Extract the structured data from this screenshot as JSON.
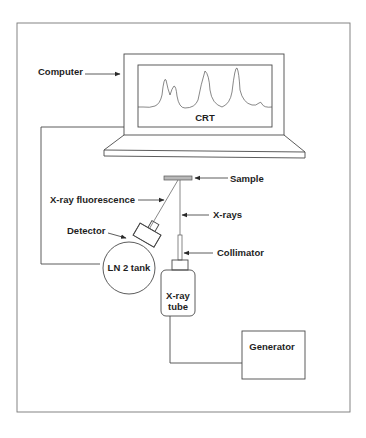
{
  "diagram": {
    "labels": {
      "computer": "Computer",
      "crt": "CRT",
      "sample": "Sample",
      "xray_fluorescence": "X-ray fluorescence",
      "xrays": "X-rays",
      "detector": "Detector",
      "collimator": "Collimator",
      "ln2_tank": "LN 2 tank",
      "xray_tube_line1": "X-ray",
      "xray_tube_line2": "tube",
      "generator": "Generator"
    },
    "colors": {
      "line": "#4a4a4a",
      "text": "#1e1e1e",
      "sample_fill": "#b8b8b8",
      "background": "#ffffff"
    },
    "components": [
      {
        "id": "computer",
        "label": "Computer",
        "contains": "CRT"
      },
      {
        "id": "sample",
        "label": "Sample"
      },
      {
        "id": "detector",
        "label": "Detector",
        "attached_to": "LN 2 tank"
      },
      {
        "id": "ln2_tank",
        "label": "LN 2 tank"
      },
      {
        "id": "collimator",
        "label": "Collimator"
      },
      {
        "id": "xray_tube",
        "label": "X-ray tube"
      },
      {
        "id": "generator",
        "label": "Generator"
      }
    ],
    "connections": [
      {
        "from": "ln2_tank",
        "to": "computer"
      },
      {
        "from": "xray_tube",
        "to": "generator"
      },
      {
        "from": "xray_tube",
        "to": "sample",
        "via": "collimator",
        "label": "X-rays"
      },
      {
        "from": "sample",
        "to": "detector",
        "label": "X-ray fluorescence"
      }
    ]
  }
}
